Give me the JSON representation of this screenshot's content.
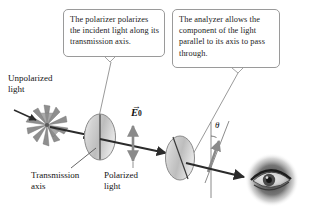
{
  "figure": {
    "background_color": "#ffffff",
    "ink_color": "#1a1a1a",
    "disk_color": "#c8c8c8",
    "beam_color": "#2b2b2b",
    "leader_color": "#8d8d8d"
  },
  "callouts": [
    {
      "id": "polarizer",
      "text": "The polarizer polarizes the incident light along its transmission axis.",
      "border_color": "#9a9a9a"
    },
    {
      "id": "analyzer",
      "text": "The analyzer allows the component of the light parallel to its axis to pass through.",
      "border_color": "#9a9a9a"
    }
  ],
  "labels": {
    "unpolarized": "Unpolarized\nlight",
    "transmission_axis": "Transmission\naxis",
    "polarized": "Polarized\nlight",
    "efield_vector": "E",
    "efield_subscript": "0",
    "efield_arrow": "→",
    "angle": "θ"
  },
  "elements": {
    "starburst": "unpolarized-light-starburst",
    "polarizer_disk": "polarizer-disk",
    "analyzer_disk": "analyzer-disk",
    "eye": "observer-eye",
    "beam": "light-beam",
    "oscillation_arrow": "field-oscillation-arrow",
    "component_arrow": "transmitted-component-arrow",
    "angle_arc": "angle-arc"
  }
}
